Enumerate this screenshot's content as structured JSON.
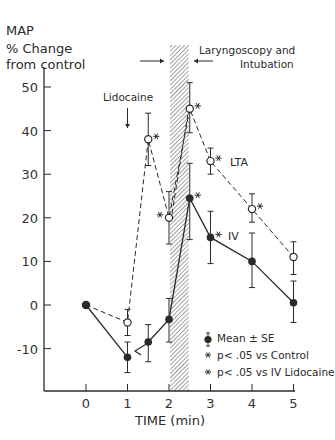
{
  "chart_data": {
    "type": "line",
    "title": "",
    "ylabel_lines": [
      "MAP",
      "% Change",
      "from control"
    ],
    "xlabel": "TIME (min)",
    "xlim": [
      0,
      5
    ],
    "ylim": [
      -20,
      55
    ],
    "x_ticks": [
      0,
      1,
      2,
      3,
      4,
      5
    ],
    "y_ticks": [
      -10,
      0,
      10,
      20,
      30,
      40,
      50
    ],
    "y_tick_labels": [
      "-10",
      "0",
      "10",
      "20",
      "30",
      "40",
      "50"
    ],
    "x_tick_labels": [
      "0",
      "1",
      "2",
      "3",
      "4",
      "5"
    ],
    "grid": false,
    "series": [
      {
        "name": "LTA",
        "style": "dashed",
        "marker": "open-circle",
        "x": [
          0,
          1,
          1.5,
          2,
          2.5,
          3,
          4,
          5
        ],
        "values": [
          0,
          -4,
          38,
          20,
          45,
          33,
          22,
          11
        ],
        "err_low": [
          0,
          -7,
          32,
          14,
          39.5,
          30,
          19,
          7
        ],
        "err_high": [
          0,
          -1,
          44,
          26,
          51,
          36,
          25.5,
          14.5
        ],
        "significant_vs_control": [
          false,
          false,
          true,
          true,
          true,
          true,
          true,
          false
        ]
      },
      {
        "name": "IV",
        "style": "solid",
        "marker": "filled-circle",
        "x": [
          0,
          1,
          1.5,
          2,
          2.5,
          3,
          4,
          5
        ],
        "values": [
          0,
          -12,
          -8.5,
          -3.3,
          24.5,
          15.5,
          10,
          0.5
        ],
        "err_low": [
          0,
          -15.5,
          -13,
          -8.5,
          15,
          9.5,
          4,
          -4
        ],
        "err_high": [
          0,
          -8.5,
          -4.5,
          1.5,
          32.5,
          21.5,
          16.5,
          5.5
        ],
        "significant_vs_control": [
          false,
          false,
          false,
          false,
          true,
          true,
          false,
          false
        ]
      }
    ],
    "annotations": [
      {
        "text": "Lidocaine",
        "x": 1,
        "type": "arrow-down"
      },
      {
        "text": "Laryngoscopy and Intubation",
        "x_range": [
          2,
          2.5
        ],
        "type": "hatched-band"
      },
      {
        "text": "LTA",
        "series_label": true
      },
      {
        "text": "IV",
        "series_label": true
      }
    ],
    "legend": [
      {
        "symbol": "mean-se",
        "label": "Mean ± SE"
      },
      {
        "symbol": "asterisk",
        "label": "p< .05 vs Control"
      },
      {
        "symbol": "asterisk",
        "label": "p< .05 vs IV Lidocaine"
      }
    ],
    "legend_position": "lower-right"
  },
  "labels": {
    "ylabel_1": "MAP",
    "ylabel_2": "% Change",
    "ylabel_3": "from control",
    "xlabel": "TIME (min)",
    "lidocaine": "Lidocaine",
    "laryngoscopy_1": "Laryngoscopy and",
    "laryngoscopy_2": "Intubation",
    "lta": "LTA",
    "iv": "IV",
    "legend_mean": "Mean ± SE",
    "legend_control": "p< .05 vs Control",
    "legend_iv": "p< .05 vs IV Lidocaine"
  },
  "colors": {
    "ink": "#2a2a2a",
    "background": "#ffffff"
  }
}
